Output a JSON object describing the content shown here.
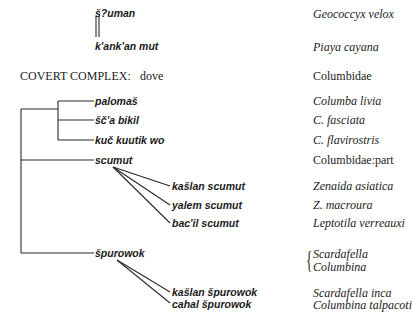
{
  "top_pair": {
    "upper": {
      "term": "š?uman",
      "scientific": "Geococcyx velox"
    },
    "lower": {
      "term": "k'ank'an mut",
      "scientific": "Piaya cayana"
    }
  },
  "heading": {
    "label": "COVERT COMPLEX:",
    "value": "dove",
    "scientific": "Columbidae"
  },
  "group_one": [
    {
      "term": "palomaš",
      "scientific": "Columba livia"
    },
    {
      "term": "šč'a bikil",
      "scientific": "C. fasciata"
    },
    {
      "term": "kuč kuutik wo",
      "scientific": "C. flavirostris"
    }
  ],
  "scumut": {
    "term": "scumut",
    "scientific": "Columbidae:part",
    "children": [
      {
        "term": "kašlan scumut",
        "scientific": "Zenaida asiatica"
      },
      {
        "term": "yalem scumut",
        "scientific": "Z. macroura"
      },
      {
        "term": "bac'il scumut",
        "scientific": "Leptotila verreauxi"
      }
    ]
  },
  "spurowok": {
    "term": "špurowok",
    "scientific_brace": [
      "Scardafella",
      "Columbina"
    ],
    "children": [
      {
        "term": "kašlan špurowok",
        "scientific": "Scardafella inca"
      },
      {
        "term": "cahal špurowok",
        "scientific": "Columbina talpacoti"
      }
    ]
  },
  "colors": {
    "line": "#2a2a2a",
    "text": "#1a1a1a",
    "background": "#ffffff"
  }
}
